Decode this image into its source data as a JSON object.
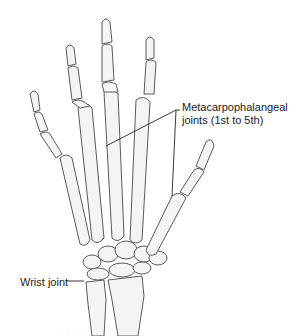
{
  "figure": {
    "labels": {
      "mcp_line1": "Metacarpophalangeal",
      "mcp_line2": "joints (1st to 5th)",
      "wrist": "Wrist joint"
    },
    "caption_faint": "· · · · ·   · · ·   · · ·"
  },
  "colors": {
    "background": "#ffffff",
    "bone_fill": "#f4f4f4",
    "bone_outline": "#5a5a5a",
    "label_text": "#222222"
  }
}
